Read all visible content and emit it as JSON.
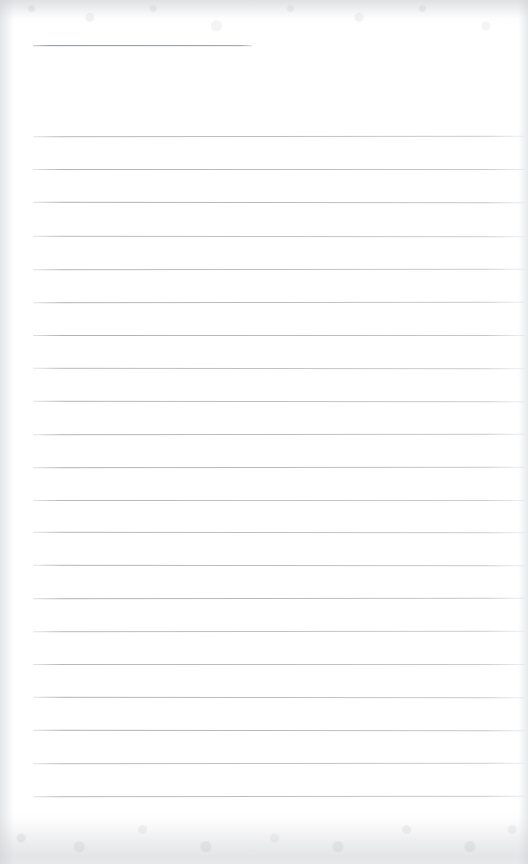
{
  "document": {
    "kind": "scanned-ruled-notepad-page",
    "title": "",
    "body_text": "",
    "is_blank": true,
    "page_width": 528,
    "page_height": 864
  },
  "colors": {
    "paper": "#ffffff",
    "rule": "#aab0b6",
    "header_rule": "#999fa6",
    "scan_edge": "#c9ccd0"
  },
  "ruling": {
    "line_start_x": 33,
    "line_end_x": 524,
    "line_spacing": 33.2,
    "first_line_y": 136,
    "last_line_y": 796,
    "line_count": 20
  },
  "header_rule": {
    "label": "title-rule",
    "start_x": 33,
    "end_x": 252,
    "y": 45,
    "length": 219
  },
  "lines": [
    {
      "index": 1,
      "y": 136,
      "x1": 33,
      "x2": 524,
      "content": ""
    },
    {
      "index": 2,
      "y": 169,
      "x1": 33,
      "x2": 524,
      "content": ""
    },
    {
      "index": 3,
      "y": 202,
      "x1": 33,
      "x2": 524,
      "content": ""
    },
    {
      "index": 4,
      "y": 236,
      "x1": 33,
      "x2": 524,
      "content": ""
    },
    {
      "index": 5,
      "y": 269,
      "x1": 33,
      "x2": 524,
      "content": ""
    },
    {
      "index": 6,
      "y": 302,
      "x1": 33,
      "x2": 524,
      "content": ""
    },
    {
      "index": 7,
      "y": 335,
      "x1": 33,
      "x2": 524,
      "content": ""
    },
    {
      "index": 8,
      "y": 368,
      "x1": 33,
      "x2": 524,
      "content": ""
    },
    {
      "index": 9,
      "y": 401,
      "x1": 33,
      "x2": 524,
      "content": ""
    },
    {
      "index": 10,
      "y": 434,
      "x1": 33,
      "x2": 524,
      "content": ""
    },
    {
      "index": 11,
      "y": 467,
      "x1": 33,
      "x2": 524,
      "content": ""
    },
    {
      "index": 12,
      "y": 500,
      "x1": 33,
      "x2": 524,
      "content": ""
    },
    {
      "index": 13,
      "y": 532,
      "x1": 33,
      "x2": 524,
      "content": ""
    },
    {
      "index": 14,
      "y": 565,
      "x1": 33,
      "x2": 524,
      "content": ""
    },
    {
      "index": 15,
      "y": 598,
      "x1": 33,
      "x2": 524,
      "content": ""
    },
    {
      "index": 16,
      "y": 631,
      "x1": 33,
      "x2": 524,
      "content": ""
    },
    {
      "index": 17,
      "y": 664,
      "x1": 33,
      "x2": 524,
      "content": ""
    },
    {
      "index": 18,
      "y": 697,
      "x1": 33,
      "x2": 524,
      "content": ""
    },
    {
      "index": 19,
      "y": 730,
      "x1": 33,
      "x2": 524,
      "content": ""
    },
    {
      "index": 20,
      "y": 763,
      "x1": 33,
      "x2": 524,
      "content": ""
    },
    {
      "index": 21,
      "y": 796,
      "x1": 33,
      "x2": 524,
      "content": ""
    }
  ]
}
